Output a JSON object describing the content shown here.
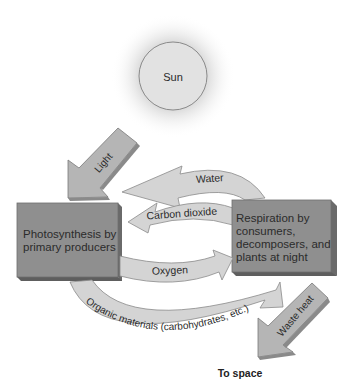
{
  "diagram": {
    "sun": {
      "label": "Sun"
    },
    "arrows": {
      "light": "Light",
      "water": "Water",
      "carbon_dioxide": "Carbon dioxide",
      "oxygen": "Oxygen",
      "organic": "Organic materials (carbohydrates, etc.)",
      "waste_heat": "Waste heat"
    },
    "boxes": {
      "photosynthesis": [
        "Photosynthesis by",
        "primary producers"
      ],
      "respiration": [
        "Respiration by",
        "consumers,",
        "decomposers, and",
        "plants at night"
      ]
    },
    "footer": "To space"
  },
  "colors": {
    "box_fill": "#8c8c8c",
    "box_side": "#6b6b6b",
    "arrow_fill": "#cfcfcf",
    "arrow_edge": "#8a8a8a",
    "sun_fill": "#e4e4e4"
  }
}
